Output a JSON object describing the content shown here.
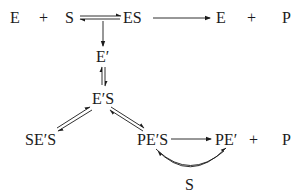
{
  "diagram": {
    "type": "reaction-scheme",
    "top_row": {
      "reactant_enzyme": "E",
      "plus_1": "+",
      "reactant_substrate": "S",
      "complex": "ES",
      "product_enzyme": "E",
      "plus_2": "+",
      "product": "P"
    },
    "intermediate_enzyme": "E′",
    "intermediate_complex": "E′S",
    "dead_end_complex": "SE′S",
    "bottom_row": {
      "product_complex": "PE′S",
      "product_enzyme_form": "PE′",
      "plus": "+",
      "product": "P"
    },
    "cycle_substrate": "S",
    "colors": {
      "ink": "#1a1a1a",
      "background": "#ffffff"
    }
  }
}
